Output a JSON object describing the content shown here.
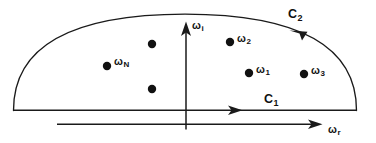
{
  "figure": {
    "kind": "complex-plane-contour-diagram",
    "width": 376,
    "height": 143,
    "background_color": "#ffffff",
    "ink_color": "#111111"
  },
  "axes": {
    "imaginary": {
      "name": "imaginary-axis",
      "symbol": "ω",
      "subscript": "i",
      "label": "ωi",
      "direction": "up"
    },
    "real": {
      "name": "real-axis",
      "symbol": "ω",
      "subscript": "r",
      "label": "ωr",
      "direction": "right"
    }
  },
  "contours": [
    {
      "id": "C1",
      "symbol": "C",
      "subscript": "1",
      "label": "C1",
      "shape": "straight-segment",
      "direction": "rightward"
    },
    {
      "id": "C2",
      "symbol": "C",
      "subscript": "2",
      "label": "C2",
      "shape": "semicircular-arc",
      "direction": "counterclockwise"
    }
  ],
  "poles": [
    {
      "id": "p-unlabeled-upper",
      "symbol": "",
      "subscript": "",
      "label": "",
      "labeled": false,
      "x": 152,
      "y": 44
    },
    {
      "id": "p-omega-N",
      "symbol": "ω",
      "subscript": "N",
      "label": "ωN",
      "labeled": true,
      "x": 107,
      "y": 66
    },
    {
      "id": "p-unlabeled-lower",
      "symbol": "",
      "subscript": "",
      "label": "",
      "labeled": false,
      "x": 152,
      "y": 89
    },
    {
      "id": "p-omega-2",
      "symbol": "ω",
      "subscript": "2",
      "label": "ω2",
      "labeled": true,
      "x": 230,
      "y": 42
    },
    {
      "id": "p-omega-1",
      "symbol": "ω",
      "subscript": "1",
      "label": "ω1",
      "labeled": true,
      "x": 249,
      "y": 73
    },
    {
      "id": "p-omega-3",
      "symbol": "ω",
      "subscript": "3",
      "label": "ω3",
      "labeled": true,
      "x": 304,
      "y": 74
    }
  ],
  "labels": {
    "omega_i": {
      "sym": "ω",
      "sub": "i"
    },
    "omega_r": {
      "sym": "ω",
      "sub": "r"
    },
    "omega_N": {
      "sym": "ω",
      "sub": "N"
    },
    "omega_1": {
      "sym": "ω",
      "sub": "1"
    },
    "omega_2": {
      "sym": "ω",
      "sub": "2"
    },
    "omega_3": {
      "sym": "ω",
      "sub": "3"
    },
    "C_1": {
      "sym": "C",
      "sub": "1"
    },
    "C_2": {
      "sym": "C",
      "sub": "2"
    }
  }
}
